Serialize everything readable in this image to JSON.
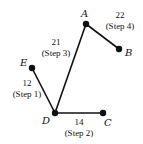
{
  "diagram": {
    "type": "weighted-graph-spanning-tree",
    "nodes": [
      {
        "id": "A",
        "label": "A",
        "x": 86,
        "y": 24,
        "lx": 81,
        "ly": 17
      },
      {
        "id": "B",
        "label": "B",
        "x": 119,
        "y": 49,
        "lx": 125,
        "ly": 56
      },
      {
        "id": "C",
        "label": "C",
        "x": 103,
        "y": 113,
        "lx": 104,
        "ly": 126
      },
      {
        "id": "D",
        "label": "D",
        "x": 55,
        "y": 113,
        "lx": 42,
        "ly": 124
      },
      {
        "id": "E",
        "label": "E",
        "x": 32,
        "y": 68,
        "lx": 20,
        "ly": 66
      }
    ],
    "edges": [
      {
        "from": "E",
        "to": "D",
        "weight": "12",
        "step": "(Step 1)",
        "wx": 27,
        "wy": 86,
        "sx": 27,
        "sy": 97
      },
      {
        "from": "D",
        "to": "C",
        "weight": "14",
        "step": "(Step 2)",
        "wx": 79,
        "wy": 125,
        "sx": 79,
        "sy": 136
      },
      {
        "from": "D",
        "to": "A",
        "weight": "21",
        "step": "(Step 3)",
        "wx": 56,
        "wy": 45,
        "sx": 56,
        "sy": 56
      },
      {
        "from": "A",
        "to": "B",
        "weight": "22",
        "step": "(Step 4)",
        "wx": 120,
        "wy": 18,
        "sx": 120,
        "sy": 29
      }
    ]
  }
}
